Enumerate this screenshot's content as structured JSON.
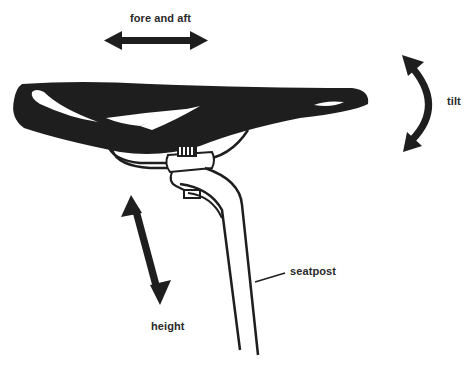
{
  "diagram": {
    "colors": {
      "ink": "#1e1e1e",
      "label": "#2a2a2a",
      "background": "#ffffff"
    },
    "labels": {
      "fore_and_aft": "fore and aft",
      "tilt": "tilt",
      "height": "height",
      "seatpost": "seatpost"
    },
    "arrows": [
      {
        "name": "fore-and-aft",
        "direction": "horizontal double-headed"
      },
      {
        "name": "tilt",
        "direction": "curved vertical double-headed"
      },
      {
        "name": "height",
        "direction": "diagonal double-headed"
      }
    ],
    "parts": [
      "saddle",
      "saddle rails",
      "seatpost clamp",
      "seatpost"
    ]
  }
}
